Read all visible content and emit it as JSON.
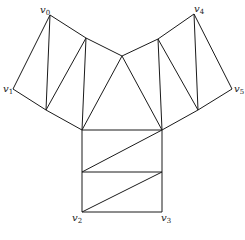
{
  "figure": {
    "caption": "",
    "caption_note": "caption present below the diagram but not legible at this resolution",
    "stroke_color": "#1a1a1a",
    "background": "#ffffff"
  },
  "labels": {
    "v0": {
      "base": "v",
      "sub": "0"
    },
    "v1": {
      "base": "v",
      "sub": "1"
    },
    "v2": {
      "base": "v",
      "sub": "2"
    },
    "v3": {
      "base": "v",
      "sub": "3"
    },
    "v4": {
      "base": "v",
      "sub": "4"
    },
    "v5": {
      "base": "v",
      "sub": "5"
    }
  }
}
